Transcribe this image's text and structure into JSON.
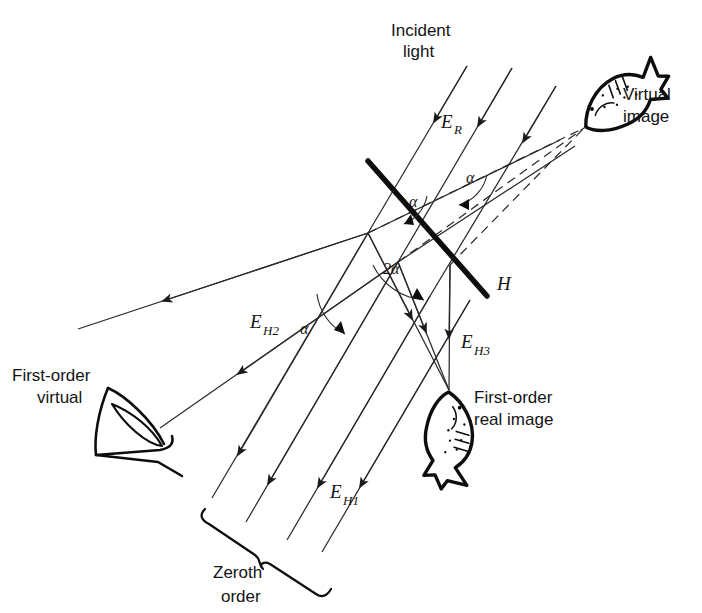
{
  "figure": {
    "kind": "optics-ray-diagram",
    "title_visible": false,
    "background_color": "#ffffff",
    "ink_color": "#141414",
    "width": 702,
    "height": 613
  },
  "labels": {
    "incident_light_line1": "Incident",
    "incident_light_line2": "light",
    "virtual_image_line1": "Virtual",
    "virtual_image_line2": "image",
    "first_order_virtual_line1": "First-order",
    "first_order_virtual_line2": "virtual",
    "first_order_real_line1": "First-order",
    "first_order_real_line2": "real image",
    "zeroth_order_line1": "Zeroth",
    "zeroth_order_line2": "order",
    "hologram": "H",
    "field_reference": "E",
    "field_reference_sub": "R",
    "field_h1": "E",
    "field_h1_sub": "H1",
    "field_h2": "E",
    "field_h2_sub": "H2",
    "field_h3": "E",
    "field_h3_sub": "H3",
    "angle_alpha_upper": "α",
    "angle_alpha_plate": "α",
    "angle_alpha_left": "α",
    "angle_two_alpha": "2α"
  },
  "objects": {
    "hologram_plate": {
      "name": "H",
      "style": "thick-solid-line"
    },
    "virtual_fish": {
      "name": "virtual image fish",
      "style": "line-art-fish"
    },
    "real_fish": {
      "name": "first-order real image fish",
      "style": "line-art-fish-inverted"
    },
    "observer_eye": {
      "name": "eye viewing first-order virtual image",
      "style": "line-art-eye"
    },
    "zeroth_order_brace": {
      "name": "brace spanning zeroth order beam"
    }
  },
  "beams": {
    "incident": {
      "label": "E_R",
      "count": 3,
      "style": "solid",
      "direction": "down-left"
    },
    "zeroth_order": {
      "label": "E_H1",
      "count": 4,
      "style": "solid",
      "direction": "down-left"
    },
    "first_order_virtual": {
      "label": "E_H2",
      "count": 2,
      "style": "solid",
      "direction": "left"
    },
    "first_order_real": {
      "label": "E_H3",
      "count": 3,
      "style": "solid",
      "direction": "down"
    },
    "virtual_image_construction": {
      "count": 3,
      "style": "dashed",
      "direction": "up-right"
    }
  },
  "angles": {
    "alpha_upper": "α",
    "alpha_at_plate": "α",
    "alpha_left": "α",
    "two_alpha": "2α"
  }
}
